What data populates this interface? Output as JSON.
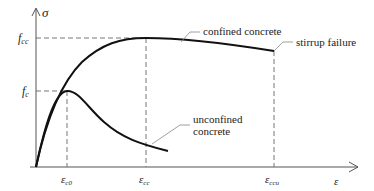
{
  "diagram": {
    "axes": {
      "y_label": "σ",
      "x_label": "ε"
    },
    "y_ticks": [
      {
        "main": "f",
        "sub": "cc"
      },
      {
        "main": "f",
        "sub": "c"
      }
    ],
    "x_ticks": [
      {
        "main": "ε",
        "sub": "c0"
      },
      {
        "main": "ε",
        "sub": "cc"
      },
      {
        "main": "ε",
        "sub": "ccu"
      }
    ],
    "annotations": {
      "confined": "confined concrete",
      "stirrup": "stirrup failure",
      "unconfined_line1": "unconfined",
      "unconfined_line2": "concrete"
    },
    "colors": {
      "curve": "#111111",
      "axis": "#555555",
      "dash": "#666666",
      "leader": "#888888"
    }
  }
}
